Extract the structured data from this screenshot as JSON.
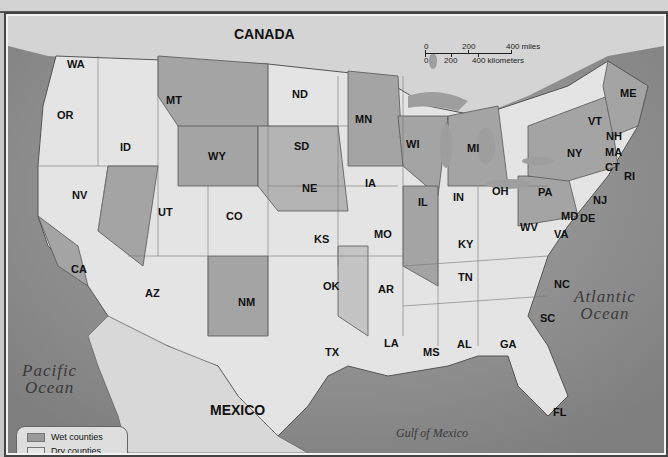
{
  "map": {
    "countries": {
      "canada": "CANADA",
      "mexico": "MEXICO"
    },
    "water": {
      "atlantic": "Atlantic Ocean",
      "atlantic_l1": "Atlantic",
      "atlantic_l2": "Ocean",
      "pacific_l1": "Pacific",
      "pacific_l2": "Ocean",
      "gulf": "Gulf of Mexico"
    },
    "states": {
      "WA": "WA",
      "OR": "OR",
      "CA": "CA",
      "NV": "NV",
      "ID": "ID",
      "MT": "MT",
      "WY": "WY",
      "UT": "UT",
      "AZ": "AZ",
      "CO": "CO",
      "NM": "NM",
      "ND": "ND",
      "SD": "SD",
      "NE": "NE",
      "KS": "KS",
      "OK": "OK",
      "TX": "TX",
      "MN": "MN",
      "IA": "IA",
      "MO": "MO",
      "AR": "AR",
      "LA": "LA",
      "WI": "WI",
      "IL": "IL",
      "MI": "MI",
      "IN": "IN",
      "OH": "OH",
      "KY": "KY",
      "TN": "TN",
      "MS": "MS",
      "AL": "AL",
      "GA": "GA",
      "FL": "FL",
      "SC": "SC",
      "NC": "NC",
      "VA": "VA",
      "WV": "WV",
      "PA": "PA",
      "NY": "NY",
      "VT": "VT",
      "NH": "NH",
      "ME": "ME",
      "MA": "MA",
      "CT": "CT",
      "RI": "RI",
      "NJ": "NJ",
      "MD": "MD",
      "DE": "DE"
    },
    "scale": {
      "mi0": "0",
      "mi200": "200",
      "mi400": "400 miles",
      "km0": "0",
      "km200": "200",
      "km400": "400 kilometers"
    },
    "legend": [
      {
        "label": "Wet counties",
        "color": "#9b9b9b"
      },
      {
        "label": "Dry counties",
        "color": "#e6e6e6"
      }
    ]
  }
}
